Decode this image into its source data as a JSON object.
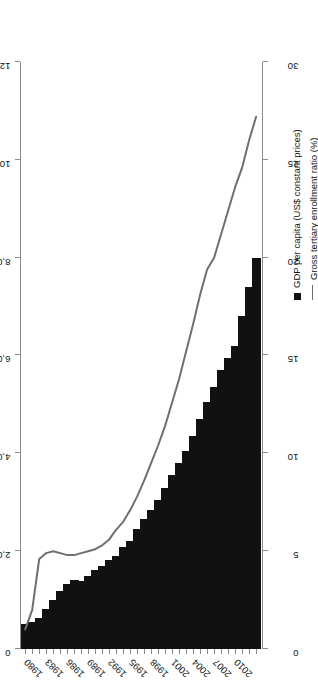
{
  "chart_data": {
    "type": "bar",
    "title": "",
    "orientation": "horizontal-rotated",
    "xlabel": "",
    "ylabel": "",
    "categories": [
      "1980",
      "1981",
      "1982",
      "1983",
      "1984",
      "1985",
      "1986",
      "1987",
      "1988",
      "1989",
      "1990",
      "1991",
      "1992",
      "1993",
      "1994",
      "1995",
      "1996",
      "1997",
      "1998",
      "1999",
      "2000",
      "2001",
      "2002",
      "2003",
      "2004",
      "2005",
      "2006",
      "2007",
      "2008",
      "2009",
      "2010",
      "2011",
      "2012",
      "2013"
    ],
    "tick_categories": [
      "1980",
      "1983",
      "1986",
      "1989",
      "1992",
      "1995",
      "1998",
      "2001",
      "2004",
      "2007",
      "2010"
    ],
    "primary_axis": {
      "label": "GDP per capita (US$ constant prices)",
      "ticks": [
        "0",
        "2,000",
        "4,000",
        "6,000",
        "8,000",
        "10,000",
        "12,000"
      ],
      "tick_values": [
        0,
        2000,
        4000,
        6000,
        8000,
        10000,
        12000
      ],
      "lim": [
        0,
        12000
      ],
      "position": "top"
    },
    "secondary_axis": {
      "label": "Gross tertiary enrollment ratio (%)",
      "ticks": [
        "0",
        "5",
        "10",
        "15",
        "20",
        "25",
        "30"
      ],
      "tick_values": [
        0,
        5,
        10,
        15,
        20,
        25,
        30
      ],
      "lim": [
        0,
        30
      ],
      "position": "bottom"
    },
    "series": [
      {
        "name": "GDP per capita (US$ constant prices)",
        "type": "bar",
        "axis": "primary",
        "color": "#111111",
        "values": [
          520,
          560,
          640,
          820,
          1000,
          1180,
          1320,
          1420,
          1380,
          1500,
          1620,
          1700,
          1820,
          1900,
          2080,
          2200,
          2450,
          2650,
          2850,
          3050,
          3300,
          3550,
          3800,
          4050,
          4350,
          4700,
          5050,
          5350,
          5700,
          5950,
          6200,
          6800,
          7400,
          8000
        ]
      },
      {
        "name": "Gross tertiary enrollment ratio (%)",
        "type": "line",
        "axis": "secondary",
        "color": "#6f6f6f",
        "values": [
          1.0,
          2.0,
          4.6,
          4.9,
          5.0,
          4.9,
          4.8,
          4.8,
          4.9,
          5.0,
          5.1,
          5.3,
          5.6,
          6.1,
          6.5,
          7.1,
          7.8,
          8.6,
          9.5,
          10.4,
          11.4,
          12.6,
          13.8,
          15.2,
          16.6,
          18.1,
          19.4,
          20.0,
          21.2,
          22.4,
          23.6,
          24.6,
          26.0,
          27.2
        ]
      }
    ],
    "grid": false,
    "legend_position": "right"
  },
  "legend": {
    "bar_label": "GDP per capita (US$ constant prices)",
    "line_label": "Gross tertiary enrollment ratio (%)"
  }
}
